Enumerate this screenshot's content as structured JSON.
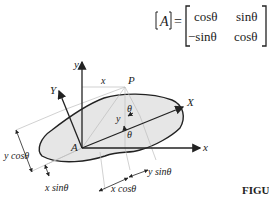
{
  "equation": {
    "lhs": "A",
    "equals": "=",
    "matrix": [
      [
        "cosθ",
        "sinθ"
      ],
      [
        "−sinθ",
        "cosθ"
      ]
    ]
  },
  "diagram": {
    "axis_labels": {
      "y": "y",
      "x": "x",
      "Y": "Y",
      "X": "X"
    },
    "point_labels": {
      "P": "P",
      "A": "A"
    },
    "coord_labels": {
      "x": "x",
      "y": "y"
    },
    "angle_label": "θ",
    "dimension_labels": {
      "y_cos": "y cosθ",
      "x_sin": "x sinθ",
      "x_cos": "x cosθ",
      "y_sin": "y sinθ"
    }
  },
  "caption": {
    "text": "FIGU"
  }
}
